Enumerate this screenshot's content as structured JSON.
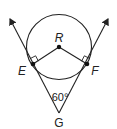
{
  "diagram": {
    "type": "geometry",
    "labels": {
      "center": "R",
      "tangent_point_left": "E",
      "tangent_point_right": "F",
      "external_point": "G",
      "angle_at_G": "60°"
    },
    "colors": {
      "stroke": "#222222",
      "background": "#ffffff"
    }
  }
}
